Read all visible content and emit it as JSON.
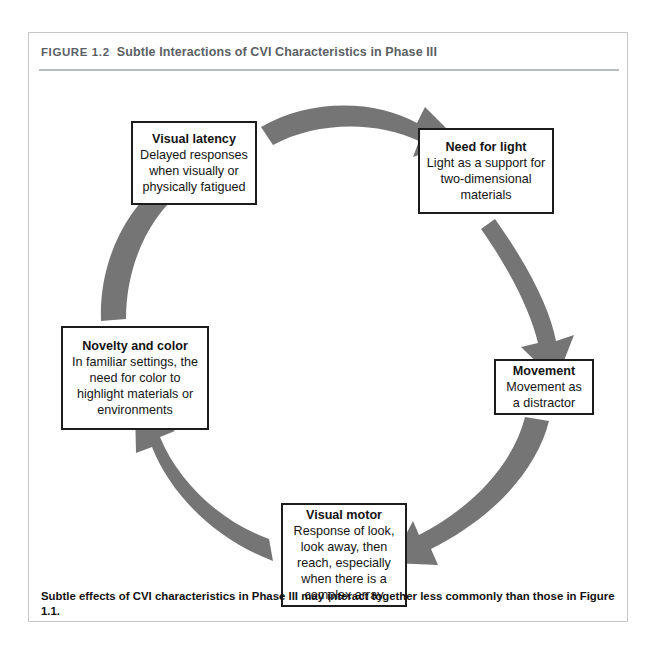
{
  "page_header": {
    "folio": "16",
    "running_head": "CVI and Functional Vision"
  },
  "figure": {
    "number_label": "FIGURE 1.2",
    "title": "Subtle Interactions of CVI Characteristics in Phase III",
    "caption": "Subtle effects of CVI characteristics in Phase III may interact together less commonly than those in Figure 1.1.",
    "colors": {
      "arrow": "#757575",
      "box_border": "#1c1c1c",
      "frame_border": "#c7c7c7",
      "title_text": "#5b6064",
      "rule": "#b9bcbe"
    },
    "nodes": [
      {
        "id": "visual-latency",
        "title": "Visual latency",
        "description": "Delayed responses when visually or physically fatigued"
      },
      {
        "id": "need-for-light",
        "title": "Need for light",
        "description": "Light as a support for two-dimensional materials"
      },
      {
        "id": "movement",
        "title": "Movement",
        "description": "Movement as a distractor"
      },
      {
        "id": "visual-motor",
        "title": "Visual motor",
        "description": "Response of look, look away, then reach, especially when there is a complex array"
      },
      {
        "id": "novelty-and-color",
        "title": "Novelty and color",
        "description": "In familiar settings, the need for color to highlight materials or environments"
      }
    ],
    "arrows": [
      {
        "id": "arrow-latency-to-light",
        "from": "visual-latency",
        "to": "need-for-light"
      },
      {
        "id": "arrow-light-to-movement",
        "from": "need-for-light",
        "to": "movement"
      },
      {
        "id": "arrow-movement-to-motor",
        "from": "movement",
        "to": "visual-motor"
      },
      {
        "id": "arrow-motor-to-novelty",
        "from": "visual-motor",
        "to": "novelty-and-color"
      },
      {
        "id": "arrow-novelty-to-latency",
        "from": "novelty-and-color",
        "to": "visual-latency"
      }
    ]
  }
}
